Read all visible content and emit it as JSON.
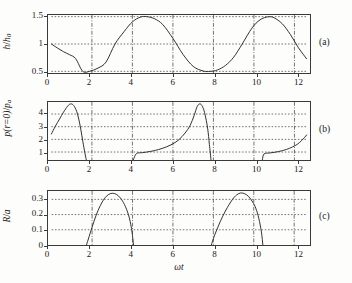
{
  "figure": {
    "panel_tags": [
      "(a)",
      "(b)",
      "(c)"
    ],
    "xlabel": "ωt",
    "xticks": [
      "0",
      "2",
      "4",
      "6",
      "8",
      "10",
      "12"
    ],
    "xtick_values": [
      0,
      2,
      4,
      6,
      8,
      10,
      12
    ],
    "xlim": [
      0,
      12.6
    ],
    "colors": {
      "axis": "#3a3a3a",
      "curve": "#2b2b2b",
      "grid": "#4a4a4a",
      "background": "#fdfdfb"
    }
  },
  "chart_data": [
    {
      "type": "line",
      "panel": "(a)",
      "title": "",
      "xlabel": "",
      "ylabel": "h/h₀",
      "ylabel_parts": {
        "num": "h",
        "den": "h",
        "den_sub": "0"
      },
      "xlim": [
        0,
        12.6
      ],
      "ylim": [
        0.47,
        1.53
      ],
      "yticks": [
        0.5,
        1,
        1.5
      ],
      "ytick_labels": [
        "0.5",
        "1",
        "1.5"
      ],
      "grid": true,
      "legend": "none",
      "description": "Sinusoidal gap height h/h0 = 1 - 0.5*cos(wt - pi) oscillating between 0.5 and 1.5 with period about 6.28",
      "x": [
        0,
        0.3,
        0.6,
        0.9,
        1.2,
        1.55,
        1.9,
        2.3,
        2.7,
        3.14,
        3.6,
        4.0,
        4.4,
        4.71,
        5.1,
        5.5,
        6.0,
        6.5,
        7.0,
        7.5,
        7.85,
        8.2,
        8.6,
        9.0,
        9.42,
        9.9,
        10.3,
        10.7,
        11.0,
        11.4,
        11.8,
        12.2,
        12.6
      ],
      "y": [
        1.0,
        0.926,
        0.859,
        0.804,
        0.732,
        0.5,
        0.503,
        0.56,
        0.671,
        1.0,
        1.232,
        1.405,
        1.492,
        1.5,
        1.46,
        1.354,
        1.103,
        0.809,
        0.591,
        0.506,
        0.5,
        0.526,
        0.61,
        0.759,
        1.0,
        1.29,
        1.442,
        1.497,
        1.478,
        1.369,
        1.173,
        0.93,
        0.73
      ]
    },
    {
      "type": "line",
      "panel": "(b)",
      "title": "",
      "xlabel": "",
      "ylabel": "p(r=0)/pₐ",
      "ylabel_parts": {
        "num": "p(r=0)",
        "den": "p",
        "den_sub": "a"
      },
      "xlim": [
        0,
        12.6
      ],
      "ylim": [
        0.37,
        4.95
      ],
      "yticks": [
        1,
        2,
        3,
        4
      ],
      "ytick_labels": [
        "1",
        "2",
        "3",
        "4"
      ],
      "grid": true,
      "legend": "none",
      "description": "Central pressure: three branches separated by bubble lifetimes; each branch rises to a peak near 4.8 then collapses steeply to the axis floor",
      "segments": [
        {
          "x": [
            0,
            0.2,
            0.4,
            0.6,
            0.8,
            0.95,
            1.1,
            1.25,
            1.35,
            1.45,
            1.55,
            1.65,
            1.72
          ],
          "y": [
            2.42,
            3.05,
            3.6,
            4.15,
            4.62,
            4.8,
            4.68,
            4.2,
            3.6,
            2.8,
            1.85,
            0.95,
            0.4
          ]
        },
        {
          "x": [
            4.05,
            4.2,
            4.5,
            4.9,
            5.3,
            5.7,
            6.0,
            6.3,
            6.6,
            6.85,
            7.05,
            7.2,
            7.35,
            7.5,
            7.62,
            7.72,
            7.8,
            7.88
          ],
          "y": [
            0.4,
            0.88,
            0.95,
            1.05,
            1.2,
            1.42,
            1.65,
            1.98,
            2.5,
            3.1,
            3.9,
            4.6,
            4.8,
            4.45,
            3.7,
            2.8,
            1.6,
            0.4
          ]
        },
        {
          "x": [
            10.42,
            10.5,
            10.8,
            11.2,
            11.6,
            11.9,
            12.15,
            12.35,
            12.5,
            12.6
          ],
          "y": [
            0.4,
            0.85,
            0.93,
            1.03,
            1.2,
            1.4,
            1.62,
            1.9,
            2.15,
            2.35
          ]
        }
      ]
    },
    {
      "type": "line",
      "panel": "(c)",
      "title": "",
      "xlabel": "ωt",
      "ylabel": "R/a",
      "ylabel_parts": {
        "num": "R",
        "den": "a",
        "den_sub": ""
      },
      "xlim": [
        0,
        12.6
      ],
      "ylim": [
        0,
        0.355
      ],
      "yticks": [
        0,
        0.1,
        0.2,
        0.3
      ],
      "ytick_labels": [
        "0",
        "0.1",
        "0.2",
        "0.3"
      ],
      "grid": true,
      "legend": "none",
      "description": "Bubble radius R/a: two growth-and-collapse cycles peaking near 0.34",
      "segments": [
        {
          "x": [
            1.72,
            1.85,
            2.0,
            2.2,
            2.4,
            2.6,
            2.8,
            3.0,
            3.2,
            3.4,
            3.6,
            3.8,
            3.95,
            4.05
          ],
          "y": [
            0,
            0.055,
            0.118,
            0.196,
            0.258,
            0.304,
            0.331,
            0.34,
            0.333,
            0.309,
            0.266,
            0.198,
            0.108,
            0
          ]
        },
        {
          "x": [
            7.9,
            8.05,
            8.25,
            8.45,
            8.7,
            8.95,
            9.15,
            9.35,
            9.55,
            9.75,
            9.95,
            10.1,
            10.25,
            10.38,
            10.45
          ],
          "y": [
            0,
            0.06,
            0.125,
            0.185,
            0.248,
            0.3,
            0.329,
            0.342,
            0.337,
            0.318,
            0.282,
            0.242,
            0.175,
            0.085,
            0
          ]
        }
      ]
    }
  ]
}
